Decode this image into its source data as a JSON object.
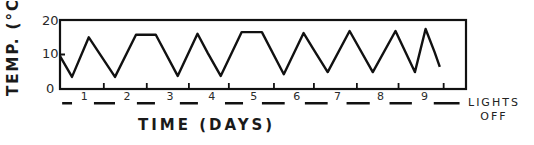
{
  "chart_data": {
    "type": "line",
    "title": "",
    "xlabel": "TIME (DAYS)",
    "ylabel": "TEMP. (°C)",
    "ylim": [
      0,
      20
    ],
    "xlim": [
      0,
      9.45
    ],
    "yticks": [
      0,
      10,
      20
    ],
    "xtick_labels": [
      "1",
      "2",
      "3",
      "4",
      "5",
      "6",
      "7",
      "8",
      "9"
    ],
    "grid": false,
    "legend": null,
    "annotation": "LIGHTS OFF",
    "annotation_line1": "LIGHTS",
    "annotation_line2": "OFF",
    "series": [
      {
        "name": "Temperature",
        "x": [
          0.0,
          0.28,
          0.67,
          1.28,
          1.77,
          2.23,
          2.74,
          3.2,
          3.44,
          3.74,
          4.23,
          4.7,
          5.21,
          5.67,
          5.88,
          6.23,
          6.74,
          7.28,
          7.81,
          8.26,
          8.51,
          8.72,
          8.84
        ],
        "y": [
          9.5,
          3.5,
          15.0,
          3.5,
          15.7,
          15.7,
          3.8,
          16.0,
          10.4,
          3.8,
          16.5,
          16.5,
          4.3,
          16.2,
          11.9,
          4.9,
          16.8,
          4.9,
          16.8,
          4.9,
          17.4,
          10.7,
          6.4
        ]
      }
    ],
    "lights_off_periods_days": [
      [
        0.05,
        0.28
      ],
      [
        0.79,
        1.28
      ],
      [
        1.79,
        2.21
      ],
      [
        2.79,
        3.21
      ],
      [
        3.84,
        4.26
      ],
      [
        4.7,
        5.23
      ],
      [
        5.7,
        6.23
      ],
      [
        6.67,
        7.21
      ],
      [
        7.67,
        8.19
      ],
      [
        8.7,
        9.3
      ]
    ]
  },
  "yaxis": {
    "label": "TEMP. (°C)",
    "ticks": [
      "0",
      "10",
      "20"
    ]
  },
  "xaxis": {
    "label": "TIME (DAYS)",
    "numbers": [
      "1",
      "2",
      "3",
      "4",
      "5",
      "6",
      "7",
      "8",
      "9"
    ]
  },
  "legend": {
    "line1": "LIGHTS",
    "line2": "OFF"
  },
  "colors": {
    "ink": "#111111",
    "background": "#ffffff"
  }
}
